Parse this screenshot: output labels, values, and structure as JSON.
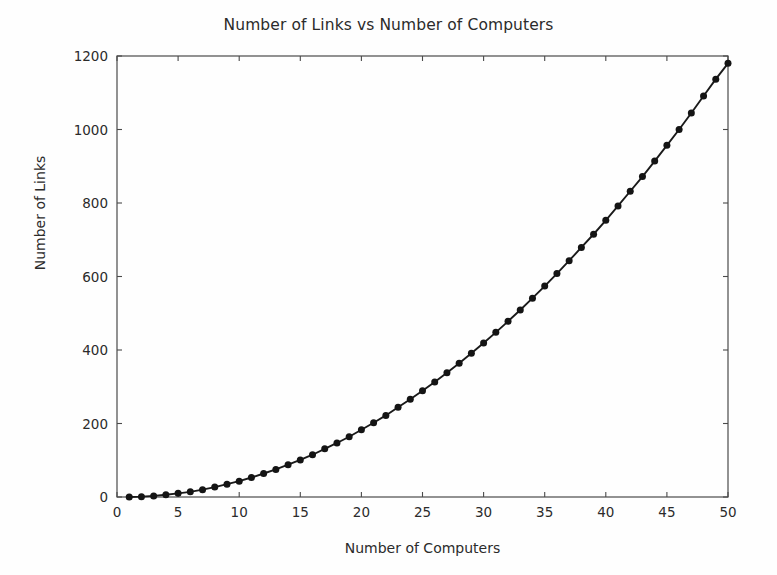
{
  "chart_data": {
    "type": "line",
    "title": "Number of Links vs Number of Computers",
    "xlabel": "Number of Computers",
    "ylabel": "Number of Links",
    "xlim": [
      0,
      50
    ],
    "ylim": [
      0,
      1200
    ],
    "xticks": [
      0,
      5,
      10,
      15,
      20,
      25,
      30,
      35,
      40,
      45,
      50
    ],
    "xtick_labels": [
      "0",
      "5",
      "10",
      "15",
      "20",
      "25",
      "30",
      "35",
      "40",
      "45",
      "50"
    ],
    "yticks": [
      0,
      200,
      400,
      600,
      800,
      1000,
      1200
    ],
    "ytick_labels": [
      "0",
      "200",
      "400",
      "600",
      "800",
      "1000",
      "1200"
    ],
    "grid": false,
    "legend": null,
    "marker": "circle",
    "line_color": "#1a1a1a",
    "marker_color": "#141414",
    "x": [
      1,
      2,
      3,
      4,
      5,
      6,
      7,
      8,
      9,
      10,
      11,
      12,
      13,
      14,
      15,
      16,
      17,
      18,
      19,
      20,
      21,
      22,
      23,
      24,
      25,
      26,
      27,
      28,
      29,
      30,
      31,
      32,
      33,
      34,
      35,
      36,
      37,
      38,
      39,
      40,
      41,
      42,
      43,
      44,
      45,
      46,
      47,
      48,
      49,
      50
    ],
    "y": [
      0,
      1,
      3,
      6,
      10,
      14,
      20,
      27,
      35,
      43,
      53,
      64,
      75,
      88,
      101,
      115,
      131,
      147,
      164,
      183,
      202,
      222,
      244,
      266,
      289,
      313,
      338,
      364,
      391,
      419,
      448,
      478,
      509,
      541,
      574,
      608,
      643,
      679,
      715,
      753,
      792,
      832,
      872,
      914,
      957,
      1000,
      1045,
      1091,
      1137,
      1180
    ],
    "series": [
      {
        "name": "links",
        "values": [
          0,
          1,
          3,
          6,
          10,
          14,
          20,
          27,
          35,
          43,
          53,
          64,
          75,
          88,
          101,
          115,
          131,
          147,
          164,
          183,
          202,
          222,
          244,
          266,
          289,
          313,
          338,
          364,
          391,
          419,
          448,
          478,
          509,
          541,
          574,
          608,
          643,
          679,
          715,
          753,
          792,
          832,
          872,
          914,
          957,
          1000,
          1045,
          1091,
          1137,
          1180
        ]
      }
    ]
  }
}
